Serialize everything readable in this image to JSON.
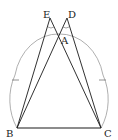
{
  "diagram": {
    "type": "geometry-construction",
    "points": {
      "A": {
        "label": "A",
        "x": 58,
        "y": 38
      },
      "B": {
        "label": "B",
        "x": 17,
        "y": 128
      },
      "C": {
        "label": "C",
        "x": 101,
        "y": 128
      },
      "D": {
        "label": "D",
        "x": 67,
        "y": 18
      },
      "E": {
        "label": "E",
        "x": 50,
        "y": 18
      }
    },
    "segments": [
      [
        "B",
        "C"
      ],
      [
        "B",
        "E"
      ],
      [
        "B",
        "D"
      ],
      [
        "C",
        "E"
      ],
      [
        "C",
        "D"
      ]
    ],
    "arc": {
      "through": [
        "B",
        "C"
      ],
      "color": "#999999",
      "tick_marks": 2
    },
    "angle_marks": [
      "E",
      "D"
    ],
    "colors": {
      "line": "#1a1a1a",
      "arc": "#9a9a9a",
      "label": "#222222"
    }
  }
}
